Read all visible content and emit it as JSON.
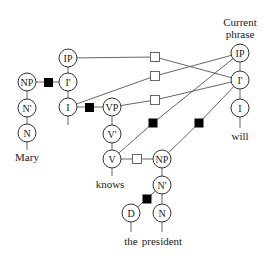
{
  "header": {
    "line1": "Current",
    "line2": "phrase"
  },
  "nodes": {
    "ip_left": "IP",
    "ibar_left": "I'",
    "i_left": "I",
    "np_mary": "NP",
    "nbar_mary": "N'",
    "n_mary": "N",
    "vp": "VP",
    "vbar": "V'",
    "v": "V",
    "np_obj": "NP",
    "nbar_obj": "N'",
    "d": "D",
    "n_obj": "N",
    "ip_right": "IP",
    "ibar_right": "I'",
    "i_right": "I"
  },
  "words": {
    "mary": "Mary",
    "knows": "knows",
    "the": "the",
    "president": "president",
    "will": "will"
  },
  "legend": {
    "open_square": "candidate attachment",
    "filled_square": "active attachment"
  }
}
